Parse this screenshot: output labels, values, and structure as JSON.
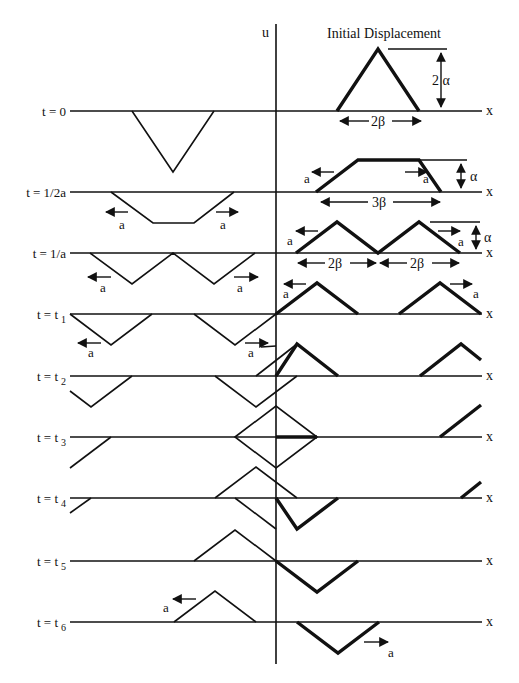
{
  "title": "Initial Displacement",
  "axis": {
    "vertical_label": "u",
    "horizontal_label": "x"
  },
  "rows": [
    {
      "id": "t0",
      "label": "t = 0",
      "sub": ""
    },
    {
      "id": "th",
      "label": "t = 1/2a",
      "sub": ""
    },
    {
      "id": "t1a",
      "label": "t = 1/a",
      "sub": ""
    },
    {
      "id": "t1",
      "label": "t = t",
      "sub": "1"
    },
    {
      "id": "t2",
      "label": "t = t",
      "sub": "2"
    },
    {
      "id": "t3",
      "label": "t = t",
      "sub": "3"
    },
    {
      "id": "t4",
      "label": "t = t",
      "sub": "4"
    },
    {
      "id": "t5",
      "label": "t = t",
      "sub": "5"
    },
    {
      "id": "t6",
      "label": "t = t",
      "sub": "6"
    }
  ],
  "dimensions": {
    "height_initial": "2 α",
    "width_initial": "2β",
    "height_half": "α",
    "width_half": "3β",
    "height_one": "α",
    "width_one_left": "2β",
    "width_one_right": "2β"
  },
  "wave_speed_label": "a"
}
